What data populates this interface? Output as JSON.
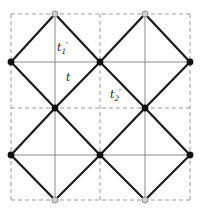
{
  "figure": {
    "kind": "lattice-diagram",
    "width": 200,
    "height": 210,
    "background_color": "#ffffff",
    "bond_color": "#1a1a1a",
    "thin_bond_color": "#8a8a8a",
    "grid_color": "#9a9a9a",
    "filled_node_color": "#111111",
    "open_node_fill": "#d0d0d0",
    "open_node_stroke": "#8a8a8a"
  },
  "labels": {
    "t1_prime": {
      "base": "t",
      "sub": "1",
      "prime": "′",
      "x": 57,
      "y": 41
    },
    "t": {
      "base": "t",
      "sub": "",
      "prime": "",
      "x": 66,
      "y": 71
    },
    "t2_prime": {
      "base": "t",
      "sub": "2",
      "prime": "′",
      "x": 110,
      "y": 88
    }
  },
  "chart_data": {
    "type": "scatter",
    "title": "",
    "xlabel": "",
    "ylabel": "",
    "xlim": [
      0,
      200
    ],
    "ylim": [
      0,
      210
    ],
    "grid": true,
    "legend_position": "none",
    "grid_lines": {
      "vertical_x": [
        11,
        55,
        100,
        145,
        190
      ],
      "horizontal_y": [
        14,
        62,
        108,
        155,
        200
      ],
      "dashed_vertical_x": [
        11,
        100,
        190
      ],
      "dashed_horizontal_y": [
        14,
        108,
        200
      ],
      "thin_vertical_x": [
        55,
        145
      ],
      "thin_horizontal_y": [
        62,
        155
      ]
    },
    "nodes_filled": [
      {
        "x": 11,
        "y": 62
      },
      {
        "x": 100,
        "y": 62
      },
      {
        "x": 190,
        "y": 62
      },
      {
        "x": 55,
        "y": 108
      },
      {
        "x": 145,
        "y": 108
      },
      {
        "x": 11,
        "y": 155
      },
      {
        "x": 100,
        "y": 155
      },
      {
        "x": 190,
        "y": 155
      }
    ],
    "nodes_open": [
      {
        "x": 55,
        "y": 14
      },
      {
        "x": 145,
        "y": 14
      },
      {
        "x": 55,
        "y": 200
      },
      {
        "x": 145,
        "y": 200
      }
    ],
    "bonds_diagonal": [
      {
        "x1": 11,
        "y1": 62,
        "x2": 55,
        "y2": 14
      },
      {
        "x1": 55,
        "y1": 14,
        "x2": 100,
        "y2": 62
      },
      {
        "x1": 100,
        "y1": 62,
        "x2": 145,
        "y2": 14
      },
      {
        "x1": 145,
        "y1": 14,
        "x2": 190,
        "y2": 62
      },
      {
        "x1": 11,
        "y1": 62,
        "x2": 55,
        "y2": 108
      },
      {
        "x1": 55,
        "y1": 108,
        "x2": 100,
        "y2": 62
      },
      {
        "x1": 100,
        "y1": 62,
        "x2": 145,
        "y2": 108
      },
      {
        "x1": 145,
        "y1": 108,
        "x2": 190,
        "y2": 62
      },
      {
        "x1": 55,
        "y1": 108,
        "x2": 11,
        "y2": 155
      },
      {
        "x1": 11,
        "y1": 155,
        "x2": 55,
        "y2": 200
      },
      {
        "x1": 55,
        "y1": 108,
        "x2": 100,
        "y2": 155
      },
      {
        "x1": 100,
        "y1": 155,
        "x2": 55,
        "y2": 200
      },
      {
        "x1": 100,
        "y1": 155,
        "x2": 145,
        "y2": 108
      },
      {
        "x1": 145,
        "y1": 108,
        "x2": 190,
        "y2": 155
      },
      {
        "x1": 100,
        "y1": 155,
        "x2": 145,
        "y2": 200
      },
      {
        "x1": 145,
        "y1": 200,
        "x2": 190,
        "y2": 155
      }
    ],
    "bonds_thin": [
      {
        "x1": 11,
        "y1": 62,
        "x2": 190,
        "y2": 62
      },
      {
        "x1": 11,
        "y1": 155,
        "x2": 190,
        "y2": 155
      },
      {
        "x1": 55,
        "y1": 14,
        "x2": 55,
        "y2": 200
      },
      {
        "x1": 145,
        "y1": 14,
        "x2": 145,
        "y2": 200
      }
    ]
  }
}
